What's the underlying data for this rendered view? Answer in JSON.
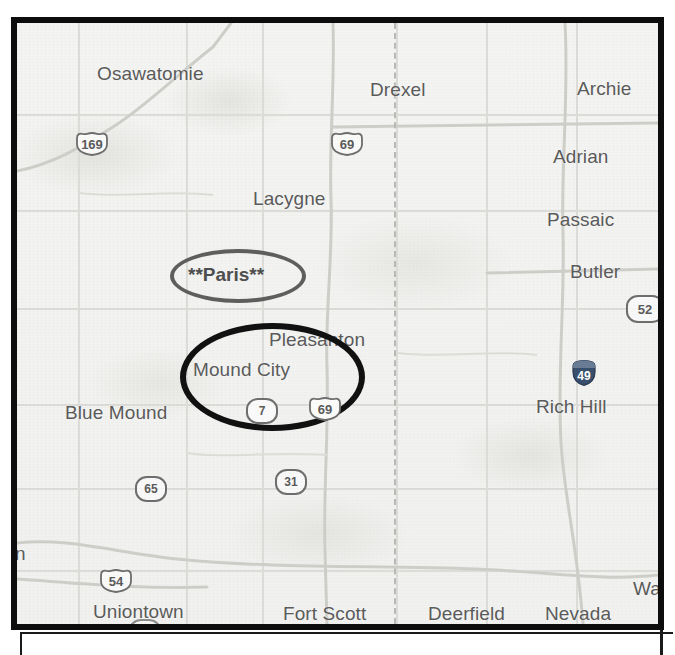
{
  "map": {
    "background_color": "#f3f3f1",
    "frame_color": "#0d0d0d",
    "label_color": "#5b5b5b",
    "cities": [
      {
        "name": "Osawatomie",
        "x": 80,
        "y": 40
      },
      {
        "name": "Drexel",
        "x": 353,
        "y": 56
      },
      {
        "name": "Archie",
        "x": 560,
        "y": 55
      },
      {
        "name": "Adrian",
        "x": 536,
        "y": 123
      },
      {
        "name": "Lacygne",
        "x": 236,
        "y": 165
      },
      {
        "name": "Passaic",
        "x": 530,
        "y": 186
      },
      {
        "name": "Butler",
        "x": 553,
        "y": 238
      },
      {
        "name": "Pleasanton",
        "x": 252,
        "y": 306
      },
      {
        "name": "Mound City",
        "x": 176,
        "y": 336
      },
      {
        "name": "Rich Hill",
        "x": 519,
        "y": 373
      },
      {
        "name": "Blue Mound",
        "x": 48,
        "y": 379
      },
      {
        "name": "n",
        "x": 18,
        "y": 520
      },
      {
        "name": "Uniontown",
        "x": 76,
        "y": 578
      },
      {
        "name": "Fort Scott",
        "x": 266,
        "y": 580
      },
      {
        "name": "Deerfield",
        "x": 411,
        "y": 580
      },
      {
        "name": "Nevada",
        "x": 528,
        "y": 580
      },
      {
        "name": "Walk",
        "x": 616,
        "y": 555
      }
    ],
    "route_shields": [
      {
        "number": "169",
        "type": "us",
        "x": 57,
        "y": 108
      },
      {
        "number": "69",
        "type": "us",
        "x": 312,
        "y": 108
      },
      {
        "number": "52",
        "type": "state",
        "x": 609,
        "y": 272
      },
      {
        "number": "49",
        "type": "interstate",
        "x": 552,
        "y": 336
      },
      {
        "number": "7",
        "type": "state",
        "x": 229,
        "y": 375
      },
      {
        "number": "69",
        "type": "us",
        "x": 290,
        "y": 373
      },
      {
        "number": "31",
        "type": "state",
        "x": 258,
        "y": 446
      },
      {
        "number": "65",
        "type": "state",
        "x": 118,
        "y": 453
      },
      {
        "number": "54",
        "type": "us",
        "x": 81,
        "y": 545
      }
    ],
    "annotations": [
      {
        "label": "**Paris**",
        "style": "light",
        "stroke_color": "#5e5e5e",
        "ellipse": {
          "x": 153,
          "y": 226,
          "width": 136,
          "height": 54
        },
        "label_x": 171,
        "label_y": 241
      },
      {
        "label": "",
        "style": "bold",
        "stroke_color": "#111111",
        "ellipse": {
          "x": 163,
          "y": 300,
          "width": 185,
          "height": 108
        },
        "label_x": 0,
        "label_y": 0
      }
    ],
    "state_boundary": {
      "x": 388,
      "label": "dashed-state-line"
    }
  }
}
